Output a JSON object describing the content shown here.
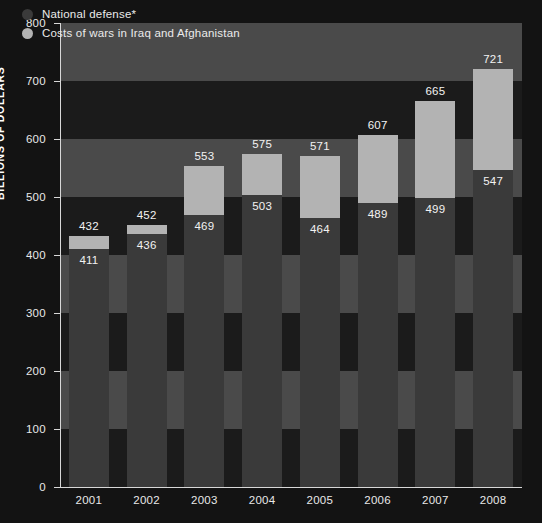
{
  "chart_data": {
    "type": "bar",
    "subtype": "stacked-bar",
    "title": "",
    "xlabel": "",
    "ylabel": "BILLIONS OF DOLLARS",
    "categories": [
      "2001",
      "2002",
      "2003",
      "2004",
      "2005",
      "2006",
      "2007",
      "2008"
    ],
    "ylim": [
      0,
      800
    ],
    "ytick_values": [
      0,
      100,
      200,
      300,
      400,
      500,
      600,
      700,
      800
    ],
    "ytick_labels": [
      "0",
      "100",
      "200",
      "300",
      "400",
      "500",
      "600",
      "700",
      "800"
    ],
    "grid": false,
    "legend_position": "top-left",
    "series": [
      {
        "name": "National defense*",
        "color": "#3a3a3a",
        "values": [
          411,
          436,
          469,
          503,
          464,
          489,
          499,
          547
        ]
      },
      {
        "name": "Costs of wars in Iraq and Afghanistan",
        "color": "#b3b3b3",
        "values": [
          21,
          16,
          84,
          72,
          107,
          118,
          166,
          174
        ]
      }
    ],
    "totals": [
      432,
      452,
      553,
      575,
      571,
      607,
      665,
      721
    ],
    "bars": [
      {
        "year": "2001",
        "defense": 411,
        "total": 432
      },
      {
        "year": "2002",
        "defense": 436,
        "total": 452
      },
      {
        "year": "2003",
        "defense": 469,
        "total": 553
      },
      {
        "year": "2004",
        "defense": 503,
        "total": 575
      },
      {
        "year": "2005",
        "defense": 464,
        "total": 571
      },
      {
        "year": "2006",
        "defense": 489,
        "total": 607
      },
      {
        "year": "2007",
        "defense": 499,
        "total": 665
      },
      {
        "year": "2008",
        "defense": 547,
        "total": 721
      }
    ],
    "background_bands": [
      {
        "from": 800,
        "to": 700
      },
      {
        "from": 600,
        "to": 500
      },
      {
        "from": 400,
        "to": 300
      },
      {
        "from": 200,
        "to": 100
      }
    ]
  },
  "legend": {
    "items": [
      {
        "label": "National defense*",
        "color": "#3a3a3a"
      },
      {
        "label": "Costs of wars in Iraq and Afghanistan",
        "color": "#b3b3b3"
      }
    ]
  },
  "colors": {
    "defense": "#3a3a3a",
    "war": "#b3b3b3",
    "band": "#4a4a4a",
    "plot_background": "#1b1b1b",
    "page_background": "#131313",
    "axis": "#d8d8d8",
    "text": "#eaeaea"
  }
}
